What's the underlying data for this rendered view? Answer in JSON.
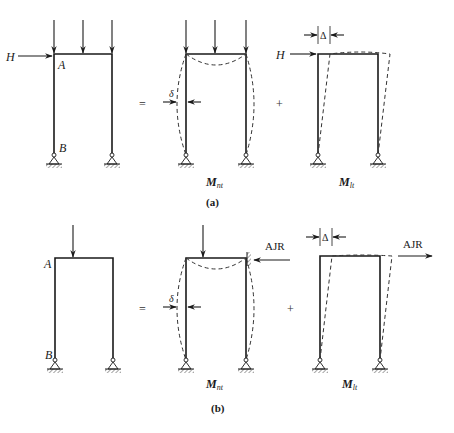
{
  "figure": {
    "colors": {
      "ink": "#1a1a1a",
      "background": "#ffffff"
    }
  },
  "part_a": {
    "caption": "(a)",
    "original": {
      "horizontal_load_label": "H",
      "joint_top_label": "A",
      "joint_base_label": "B",
      "gravity_loads_count": 3
    },
    "equals_sign": "=",
    "plus_sign": "+",
    "no_sway": {
      "moment_label": "M",
      "moment_subscript": "nt",
      "deflection_label": "δ",
      "gravity_loads_count": 3
    },
    "sway": {
      "moment_label": "M",
      "moment_subscript": "lt",
      "horizontal_load_label": "H",
      "drift_label": "Δ"
    }
  },
  "part_b": {
    "caption": "(b)",
    "original": {
      "joint_top_label": "A",
      "joint_base_label": "B",
      "gravity_loads_count": 1
    },
    "equals_sign": "=",
    "plus_sign": "+",
    "no_sway": {
      "moment_label": "M",
      "moment_subscript": "nt",
      "deflection_label": "δ",
      "restraint_label": "AJR",
      "gravity_loads_count": 1
    },
    "sway": {
      "moment_label": "M",
      "moment_subscript": "lt",
      "drift_label": "Δ",
      "applied_force_label": "AJR"
    }
  }
}
